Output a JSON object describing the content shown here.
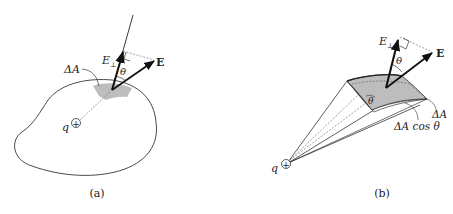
{
  "panels": [
    {
      "id": "a",
      "caption": "(a)",
      "labels": {
        "area": "ΔA",
        "e_perp": "E",
        "e_perp_sub": "⊥",
        "e_field": "E",
        "angle": "θ",
        "charge": "q",
        "charge_symbol": "+"
      }
    },
    {
      "id": "b",
      "caption": "(b)",
      "labels": {
        "area": "ΔA",
        "projected_area": "ΔA cos θ",
        "e_perp": "E",
        "e_perp_sub": "⊥",
        "e_field": "E",
        "angle": "θ",
        "angle_inner": "θ",
        "charge": "q",
        "charge_symbol": "+"
      }
    }
  ],
  "colors": {
    "line": "#222222",
    "patch_fill": "#bdbdbd",
    "arrow": "#111111",
    "dashed": "#777777"
  }
}
